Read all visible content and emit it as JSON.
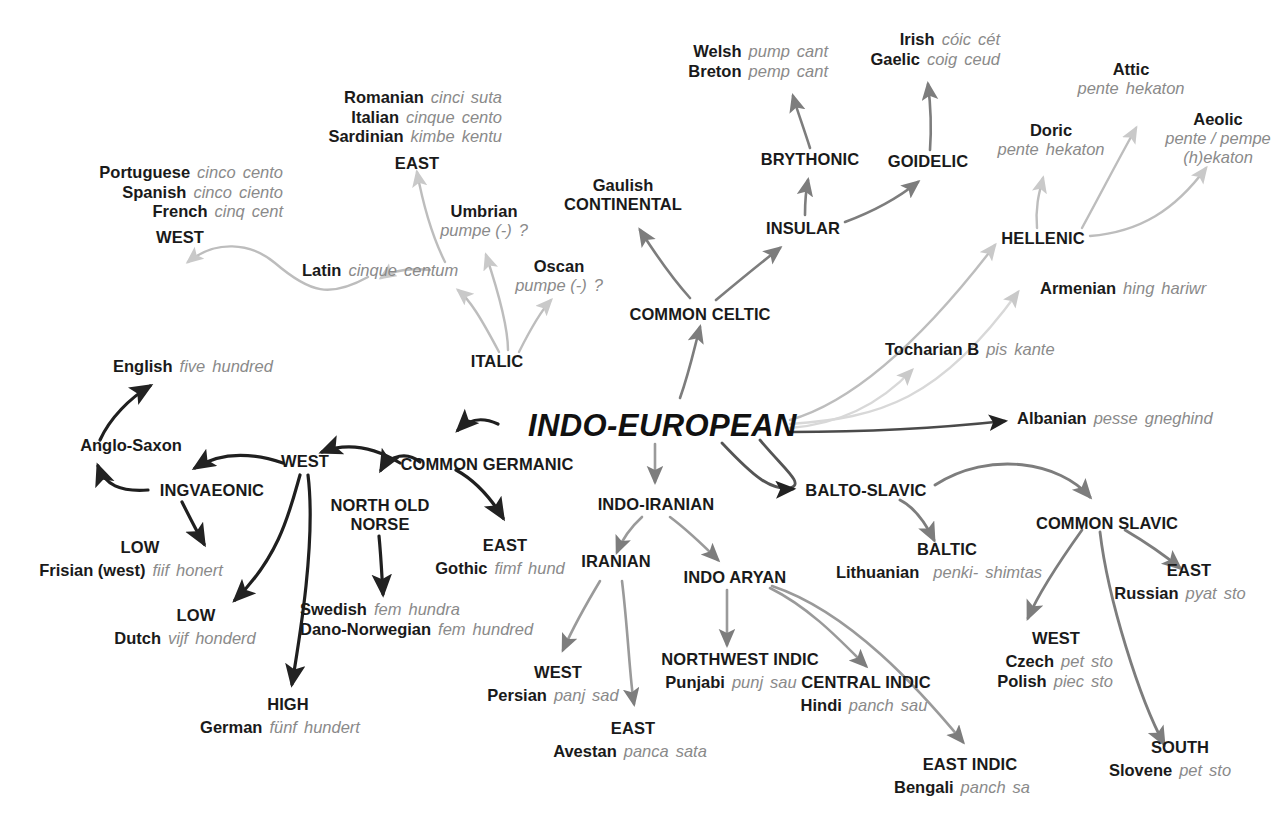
{
  "diagram": {
    "root": {
      "label": "INDO-EUROPEAN"
    },
    "colors": {
      "text": "#1a1a1a",
      "gloss": "#8a8a8a",
      "arrow_dark": "#222222",
      "arrow_mid": "#7d7d7d",
      "arrow_light": "#c9c9c9"
    },
    "nodes": {
      "romance_east_langs": [
        {
          "lang": "Romanian",
          "five": "cinci",
          "hundred": "suta"
        },
        {
          "lang": "Italian",
          "five": "cinque",
          "hundred": "cento"
        },
        {
          "lang": "Sardinian",
          "five": "kimbe",
          "hundred": "kentu"
        }
      ],
      "romance_east_group": "EAST",
      "romance_west_langs": [
        {
          "lang": "Portuguese",
          "five": "cinco",
          "hundred": "cento"
        },
        {
          "lang": "Spanish",
          "five": "cinco",
          "hundred": "ciento"
        },
        {
          "lang": "French",
          "five": "cinq",
          "hundred": "cent"
        }
      ],
      "romance_west_group": "WEST",
      "latin": {
        "lang": "Latin",
        "five": "cinque",
        "hundred": "centum"
      },
      "umbrian": {
        "lang": "Umbrian",
        "five": "pumpe (-)",
        "hundred": "?"
      },
      "oscan": {
        "lang": "Oscan",
        "five": "pumpe (-)",
        "hundred": "?"
      },
      "italic": "ITALIC",
      "brythonic_langs": [
        {
          "lang": "Welsh",
          "five": "pump",
          "hundred": "cant"
        },
        {
          "lang": "Breton",
          "five": "pemp",
          "hundred": "cant"
        }
      ],
      "brythonic": "BRYTHONIC",
      "goidelic_langs": [
        {
          "lang": "Irish",
          "five": "cóic",
          "hundred": "cét"
        },
        {
          "lang": "Gaelic",
          "five": "coig",
          "hundred": "ceud"
        }
      ],
      "goidelic": "GOIDELIC",
      "insular": "INSULAR",
      "gaulish": {
        "lang": "Gaulish"
      },
      "continental": "CONTINENTAL",
      "common_celtic": "COMMON CELTIC",
      "attic": {
        "lang": "Attic",
        "five": "pente",
        "hundred": "hekaton"
      },
      "aeolic": {
        "lang": "Aeolic",
        "five": "pente / pempe",
        "hundred": "(h)ekaton"
      },
      "doric": {
        "lang": "Doric",
        "five": "pente",
        "hundred": "hekaton"
      },
      "hellenic": "HELLENIC",
      "armenian": {
        "lang": "Armenian",
        "five": "hing",
        "hundred": "hariwr"
      },
      "tocharian": {
        "lang": "Tocharian B",
        "five": "pis",
        "hundred": "kante"
      },
      "albanian": {
        "lang": "Albanian",
        "five": "pesse",
        "hundred": "gneghind"
      },
      "english": {
        "lang": "English",
        "five": "five",
        "hundred": "hundred"
      },
      "anglo_saxon": {
        "lang": "Anglo-Saxon"
      },
      "ingvaeonic": "INGVAEONIC",
      "low_frisian_group": "LOW",
      "frisian": {
        "lang": "Frisian (west)",
        "five": "fiif",
        "hundred": "honert"
      },
      "low_dutch_group": "LOW",
      "dutch": {
        "lang": "Dutch",
        "five": "vijf",
        "hundred": "honderd"
      },
      "high_group": "HIGH",
      "german": {
        "lang": "German",
        "five": "fünf",
        "hundred": "hundert"
      },
      "west_germanic": "WEST",
      "common_germanic": "COMMON GERMANIC",
      "north_old_norse": "NORTH OLD\nNORSE",
      "north_old_norse_l1": "NORTH OLD",
      "north_old_norse_l2": "NORSE",
      "norse_langs": [
        {
          "lang": "Swedish",
          "five": "fem",
          "hundred": "hundra"
        },
        {
          "lang": "Dano-Norwegian",
          "five": "fem",
          "hundred": "hundred"
        }
      ],
      "east_germanic_group": "EAST",
      "gothic": {
        "lang": "Gothic",
        "five": "fimf",
        "hundred": "hund"
      },
      "indo_iranian": "INDO-IRANIAN",
      "iranian": "IRANIAN",
      "iranian_west_group": "WEST",
      "persian": {
        "lang": "Persian",
        "five": "panj",
        "hundred": "sad"
      },
      "iranian_east_group": "EAST",
      "avestan": {
        "lang": "Avestan",
        "five": "panca",
        "hundred": "sata"
      },
      "indo_aryan": "INDO ARYAN",
      "northwest_indic": "NORTHWEST INDIC",
      "punjabi": {
        "lang": "Punjabi",
        "five": "punj",
        "hundred": "sau"
      },
      "central_indic": "CENTRAL INDIC",
      "hindi": {
        "lang": "Hindi",
        "five": "panch",
        "hundred": "sau"
      },
      "east_indic": "EAST INDIC",
      "bengali": {
        "lang": "Bengali",
        "five": "panch",
        "hundred": "sa"
      },
      "balto_slavic": "BALTO-SLAVIC",
      "baltic": "BALTIC",
      "lithuanian": {
        "lang": "Lithuanian",
        "five": "penki-",
        "hundred": "shimtas"
      },
      "common_slavic": "COMMON SLAVIC",
      "slavic_east_group": "EAST",
      "russian": {
        "lang": "Russian",
        "five": "pyat",
        "hundred": "sto"
      },
      "slavic_west_group": "WEST",
      "slavic_west_langs": [
        {
          "lang": "Czech",
          "five": "pet",
          "hundred": "sto"
        },
        {
          "lang": "Polish",
          "five": "piec",
          "hundred": "sto"
        }
      ],
      "slavic_south_group": "SOUTH",
      "slovene": {
        "lang": "Slovene",
        "five": "pet",
        "hundred": "sto"
      }
    }
  }
}
